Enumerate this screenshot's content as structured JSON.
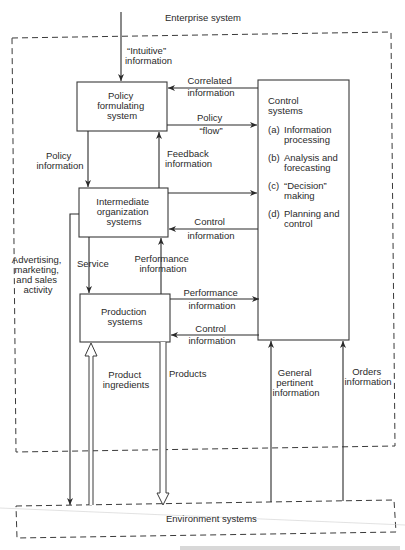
{
  "title": "Enterprise system",
  "boxes": {
    "policy": [
      "Policy",
      "formulating",
      "system"
    ],
    "intermediate": [
      "Intermediate",
      "organization",
      "systems"
    ],
    "production": [
      "Production",
      "systems"
    ],
    "control": {
      "title": [
        "Control",
        "systems"
      ],
      "items": [
        {
          "label": "(a)",
          "lines": [
            "Information",
            "processing"
          ]
        },
        {
          "label": "(b)",
          "lines": [
            "Analysis and",
            "forecasting"
          ]
        },
        {
          "label": "(c)",
          "lines": [
            "“Decision”",
            "making"
          ]
        },
        {
          "label": "(d)",
          "lines": [
            "Planning and",
            "control"
          ]
        }
      ]
    },
    "environment": "Environment systems"
  },
  "flows": {
    "intuitive": [
      "“Intuitive”",
      "information"
    ],
    "correlated": [
      "Correlated",
      "information"
    ],
    "policy_flow": [
      "Policy",
      "“flow”"
    ],
    "policy_info": [
      "Policy",
      "information"
    ],
    "feedback": [
      "Feedback",
      "information"
    ],
    "control_info_1": [
      "Control",
      "information"
    ],
    "advertising": [
      "Advertising,",
      "marketing,",
      "and sales",
      "activity"
    ],
    "service": "Service",
    "performance_info_1": [
      "Performance",
      "information"
    ],
    "performance_info_2": [
      "Performance",
      "information"
    ],
    "control_info_2": [
      "Control",
      "information"
    ],
    "product_ingredients": [
      "Product",
      "ingredients"
    ],
    "products": "Products",
    "general_pertinent": [
      "General",
      "pertinent",
      "information"
    ],
    "orders": [
      "Orders",
      "information"
    ]
  },
  "colors": {
    "ink": "#2a2a2a",
    "background": "#ffffff"
  }
}
